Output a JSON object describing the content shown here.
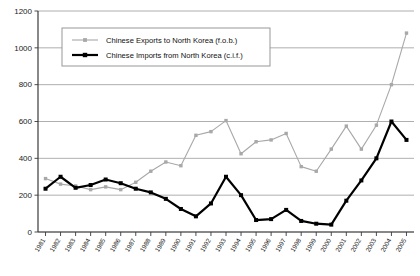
{
  "chart_data": {
    "type": "line",
    "title": "",
    "xlabel": "",
    "ylabel": "",
    "ylim": [
      0,
      1200
    ],
    "ytick_step": 200,
    "yticks": [
      0,
      200,
      400,
      600,
      800,
      1000,
      1200
    ],
    "ytick_labels": [
      "0",
      "200",
      "400",
      "600",
      "800",
      "1000",
      "1200"
    ],
    "grid": true,
    "grid_axis": "y",
    "legend_position": "top-left-inside",
    "categories": [
      "1981",
      "1982",
      "1983",
      "1984",
      "1985",
      "1986",
      "1987",
      "1988",
      "1989",
      "1990",
      "1991",
      "1992",
      "1993",
      "1994",
      "1995",
      "1996",
      "1997",
      "1998",
      "1999",
      "2000",
      "2001",
      "2002",
      "2003",
      "2004",
      "2005"
    ],
    "series": [
      {
        "name": "Chinese Exports to North Korea (f.o.b.)",
        "color": "#a8a8a8",
        "marker": "square",
        "line_width": 1.1,
        "values": [
          290,
          260,
          250,
          230,
          245,
          230,
          270,
          330,
          380,
          360,
          525,
          545,
          605,
          425,
          490,
          500,
          535,
          355,
          330,
          450,
          575,
          450,
          580,
          800,
          1080
        ]
      },
      {
        "name": "Chinese Imports from North Korea (c.i.f.)",
        "color": "#000000",
        "marker": "square",
        "line_width": 2.2,
        "values": [
          235,
          300,
          240,
          255,
          285,
          265,
          235,
          215,
          180,
          125,
          85,
          155,
          300,
          200,
          65,
          70,
          120,
          60,
          45,
          40,
          170,
          280,
          400,
          600,
          500
        ]
      }
    ],
    "legend": [
      "Chinese Exports to North Korea (f.o.b.)",
      "Chinese Imports from North Korea (c.i.f.)"
    ]
  }
}
